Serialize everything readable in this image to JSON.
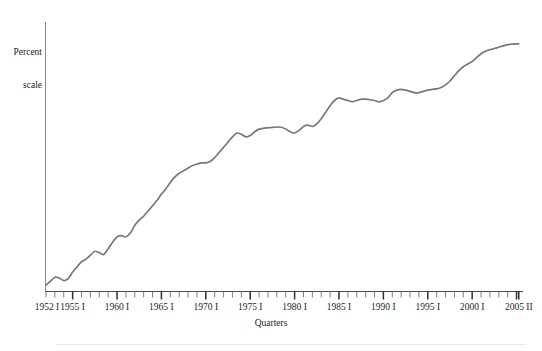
{
  "figure": {
    "y_axis_label_line1": "Percent",
    "y_axis_label_line2": "scale",
    "x_axis_title": "Quarters",
    "line_color": "#787878",
    "axis_color": "#8a8a8a",
    "tick_color": "#3a3a3a",
    "background_color": "#ffffff",
    "text_color": "#231f20"
  },
  "chart_data": {
    "type": "line",
    "title": "",
    "subtitle": "",
    "xlabel": "Quarters",
    "ylabel": "Percent scale",
    "grid": false,
    "legend": false,
    "legend_position": "none",
    "x_tick_labels": [
      "1952 I",
      "1955 I",
      "1960 I",
      "1965 I",
      "1970 I",
      "1975 I",
      "1980 I",
      "1985 I",
      "1990 I",
      "1995 I",
      "2000 I",
      "2005 II"
    ],
    "x_tick_label_positions": [
      1952,
      1955,
      1960,
      1965,
      1970,
      1975,
      1980,
      1985,
      1990,
      1995,
      2000,
      2005.25
    ],
    "x_major_ticks": [
      1955,
      1960,
      1965,
      1970,
      1975,
      1980,
      1985,
      1990,
      1995,
      2000,
      2005
    ],
    "x_minor_tick_interval": 1,
    "xlim": [
      1952,
      2005.5
    ],
    "ylim": [
      0,
      100
    ],
    "y_ticks_shown": false,
    "series": [
      {
        "name": "Percent scale index",
        "x": [
          1952.0,
          1952.5,
          1953.0,
          1953.5,
          1954.0,
          1954.5,
          1955.0,
          1955.5,
          1956.0,
          1956.5,
          1957.0,
          1957.5,
          1958.0,
          1958.5,
          1959.0,
          1959.5,
          1960.0,
          1960.5,
          1961.0,
          1961.5,
          1962.0,
          1962.5,
          1963.0,
          1963.5,
          1964.0,
          1964.5,
          1965.0,
          1965.5,
          1966.0,
          1966.5,
          1967.0,
          1967.5,
          1968.0,
          1968.5,
          1969.0,
          1969.5,
          1970.0,
          1970.5,
          1971.0,
          1971.5,
          1972.0,
          1972.5,
          1973.0,
          1973.5,
          1974.0,
          1974.5,
          1975.0,
          1975.5,
          1976.0,
          1976.5,
          1977.0,
          1977.5,
          1978.0,
          1978.5,
          1979.0,
          1979.5,
          1980.0,
          1980.5,
          1981.0,
          1981.5,
          1982.0,
          1982.5,
          1983.0,
          1983.5,
          1984.0,
          1984.5,
          1985.0,
          1985.5,
          1986.0,
          1986.5,
          1987.0,
          1987.5,
          1988.0,
          1988.5,
          1989.0,
          1989.5,
          1990.0,
          1990.5,
          1991.0,
          1991.5,
          1992.0,
          1992.5,
          1993.0,
          1993.5,
          1994.0,
          1994.5,
          1995.0,
          1995.5,
          1996.0,
          1996.5,
          1997.0,
          1997.5,
          1998.0,
          1998.5,
          1999.0,
          1999.5,
          2000.0,
          2000.5,
          2001.0,
          2001.5,
          2002.0,
          2002.5,
          2003.0,
          2003.5,
          2004.0,
          2004.5,
          2005.0,
          2005.25
        ],
        "values": [
          1.5,
          3.0,
          4.5,
          4.2,
          3.2,
          4.0,
          6.5,
          8.5,
          10.5,
          11.5,
          13.0,
          14.5,
          14.0,
          13.2,
          15.5,
          18.0,
          20.0,
          20.5,
          20.0,
          21.5,
          24.5,
          26.5,
          28.0,
          30.0,
          32.0,
          34.0,
          36.5,
          38.5,
          41.0,
          43.0,
          44.5,
          45.5,
          46.5,
          47.5,
          48.0,
          48.5,
          48.5,
          49.0,
          50.5,
          52.5,
          54.5,
          56.5,
          58.5,
          60.0,
          59.5,
          58.5,
          59.0,
          60.5,
          61.5,
          61.8,
          62.0,
          62.2,
          62.3,
          62.2,
          61.5,
          60.5,
          60.0,
          61.0,
          62.5,
          63.0,
          62.5,
          63.5,
          65.5,
          68.0,
          70.5,
          72.5,
          73.5,
          73.0,
          72.5,
          72.0,
          72.5,
          73.0,
          73.0,
          72.8,
          72.5,
          72.0,
          72.5,
          73.5,
          75.5,
          76.5,
          76.8,
          76.5,
          76.0,
          75.5,
          75.5,
          76.0,
          76.5,
          76.8,
          77.0,
          77.5,
          78.5,
          80.0,
          82.0,
          84.0,
          85.5,
          86.5,
          87.5,
          89.0,
          90.5,
          91.5,
          92.0,
          92.5,
          93.0,
          93.5,
          94.0,
          94.2,
          94.3,
          94.3
        ]
      }
    ]
  }
}
